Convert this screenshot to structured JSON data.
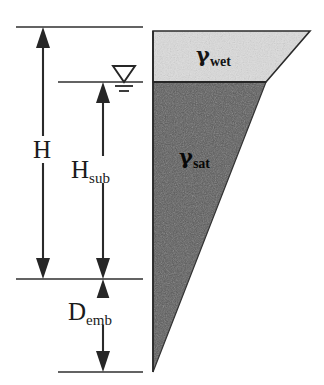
{
  "diagram": {
    "background_color": "#ffffff",
    "line_color": "#2a2a2a"
  },
  "dimensions": [
    {
      "key": "total_height",
      "name": "H",
      "symbol": "H",
      "subscript": "",
      "label_x": 30,
      "label_y": 148,
      "line_x": 43,
      "top_y": 27,
      "bottom_y": 279,
      "arrow_top": "up",
      "arrow_bottom": "down"
    },
    {
      "key": "submerged_height",
      "name": "H sub",
      "symbol": "H",
      "subscript": "sub",
      "label_x": 72,
      "label_y": 168,
      "line_x": 103,
      "top_y": 82,
      "bottom_y": 279,
      "arrow_top": "up",
      "arrow_bottom": "down"
    },
    {
      "key": "embedment_depth",
      "name": "D emb",
      "symbol": "D",
      "subscript": "emb",
      "label_x": 69,
      "label_y": 310,
      "line_x": 103,
      "top_y": 279,
      "bottom_y": 372,
      "arrow_top": "up",
      "arrow_bottom": "down"
    }
  ],
  "extension_lines": [
    {
      "key": "top-ground-line",
      "x1": 16,
      "x2": 143,
      "y": 27
    },
    {
      "key": "water-table-line",
      "x1": 58,
      "x2": 143,
      "y": 82
    },
    {
      "key": "dredge-line",
      "x1": 16,
      "x2": 143,
      "y": 279
    },
    {
      "key": "toe-line",
      "x1": 58,
      "x2": 143,
      "y": 372
    }
  ],
  "water_table": {
    "name": "groundwater-table-symbol",
    "center_x": 124,
    "surface_y": 82,
    "triangle_half_width": 11,
    "triangle_height": 16,
    "tick_widths": [
      9,
      5
    ],
    "tick_gaps": [
      4,
      8
    ]
  },
  "soil_wedge": {
    "apex_x": 153,
    "top_y": 31,
    "top_right_x": 310,
    "tip_y": 372,
    "interface_y": 82,
    "interface_right_x": 266,
    "layers": [
      {
        "key": "wet",
        "name": "gamma-wet",
        "symbol": "γ",
        "subscript": "wet",
        "fill": "#dcdcdc",
        "label_x": 196,
        "label_y": 46
      },
      {
        "key": "sat",
        "name": "gamma-sat",
        "symbol": "γ",
        "subscript": "sat",
        "fill": "#5a5a5a",
        "label_x": 179,
        "label_y": 148
      }
    ]
  }
}
